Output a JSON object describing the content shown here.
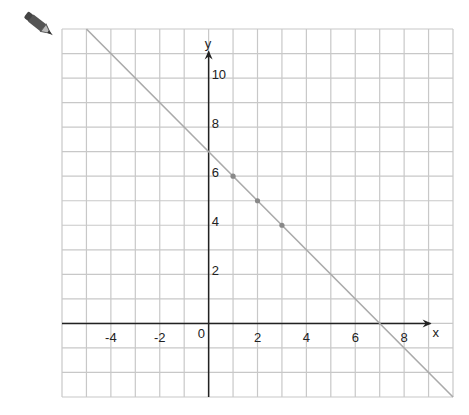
{
  "chart_data": {
    "type": "line",
    "title": "",
    "xlabel": "x",
    "ylabel": "y",
    "xlim": [
      -6,
      10
    ],
    "ylim": [
      -3,
      12
    ],
    "grid": true,
    "grid_step": 1,
    "x_ticks": [
      -4,
      -2,
      0,
      2,
      4,
      6,
      8
    ],
    "y_ticks": [
      2,
      4,
      6,
      8,
      10
    ],
    "x_tick_labels": [
      "-4",
      "-2",
      "0",
      "2",
      "4",
      "6",
      "8"
    ],
    "y_tick_labels": [
      "2",
      "4",
      "6",
      "8",
      "10"
    ],
    "origin_label": "0",
    "series": [
      {
        "name": "line",
        "equation": "y = 7 - x",
        "x": [
          -5,
          10
        ],
        "y": [
          12,
          -3
        ],
        "color": "#aaaaaa"
      }
    ],
    "points": [
      {
        "x": 1,
        "y": 6
      },
      {
        "x": 2,
        "y": 5
      },
      {
        "x": 3,
        "y": 4
      }
    ],
    "colors": {
      "grid": "#c8c8c8",
      "axis": "#222222",
      "line": "#aaaaaa",
      "point": "#888888"
    }
  },
  "tool": {
    "icon": "pencil-icon"
  }
}
